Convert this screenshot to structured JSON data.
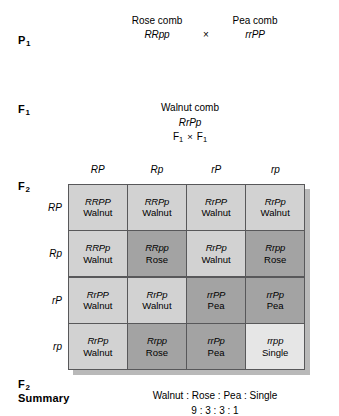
{
  "generations": {
    "p1": {
      "label": "P",
      "sub": "1",
      "parents": [
        {
          "phenotype": "Rose comb",
          "genotype": "RRpp"
        },
        {
          "phenotype": "Pea comb",
          "genotype": "rrPP"
        }
      ],
      "cross_symbol": "×"
    },
    "f1": {
      "label": "F",
      "sub": "1",
      "phenotype": "Walnut comb",
      "genotype": "RrPp",
      "selfcross": {
        "left_label": "F",
        "left_sub": "1",
        "symbol": "×",
        "right_label": "F",
        "right_sub": "1"
      }
    },
    "f2": {
      "label": "F",
      "sub": "2"
    },
    "f2_summary": {
      "label": "F",
      "sub": "2",
      "label2": "Summary",
      "phenotype_ratio_text": "Walnut : Rose : Pea : Single",
      "numeric_ratio_text": "9 : 3 : 3 : 1"
    }
  },
  "punnett": {
    "column_gametes": [
      "RP",
      "Rp",
      "rP",
      "rp"
    ],
    "row_gametes": [
      "RP",
      "Rp",
      "rP",
      "rp"
    ],
    "cells": [
      [
        {
          "genotype": "RRPP",
          "phenotype": "Walnut",
          "class": "ph-walnut"
        },
        {
          "genotype": "RRPp",
          "phenotype": "Walnut",
          "class": "ph-walnut"
        },
        {
          "genotype": "RrPP",
          "phenotype": "Walnut",
          "class": "ph-walnut"
        },
        {
          "genotype": "RrPp",
          "phenotype": "Walnut",
          "class": "ph-walnut"
        }
      ],
      [
        {
          "genotype": "RRPp",
          "phenotype": "Walnut",
          "class": "ph-walnut"
        },
        {
          "genotype": "RRpp",
          "phenotype": "Rose",
          "class": "ph-rose"
        },
        {
          "genotype": "RrPp",
          "phenotype": "Walnut",
          "class": "ph-walnut"
        },
        {
          "genotype": "Rrpp",
          "phenotype": "Rose",
          "class": "ph-rose"
        }
      ],
      [
        {
          "genotype": "RrPP",
          "phenotype": "Walnut",
          "class": "ph-walnut"
        },
        {
          "genotype": "RrPp",
          "phenotype": "Walnut",
          "class": "ph-walnut"
        },
        {
          "genotype": "rrPP",
          "phenotype": "Pea",
          "class": "ph-pea"
        },
        {
          "genotype": "rrPp",
          "phenotype": "Pea",
          "class": "ph-pea"
        }
      ],
      [
        {
          "genotype": "RrPp",
          "phenotype": "Walnut",
          "class": "ph-walnut"
        },
        {
          "genotype": "Rrpp",
          "phenotype": "Rose",
          "class": "ph-rose"
        },
        {
          "genotype": "rrPp",
          "phenotype": "Pea",
          "class": "ph-pea"
        },
        {
          "genotype": "rrpp",
          "phenotype": "Single",
          "class": "ph-single"
        }
      ]
    ]
  },
  "colors": {
    "walnut": "#d2d2d2",
    "rose": "#a3a3a3",
    "pea": "#a3a3a3",
    "single": "#e6e6e6",
    "grid_line": "#58585a",
    "shadow": "#b9b9b9",
    "text": "#000000",
    "background": "#ffffff"
  }
}
